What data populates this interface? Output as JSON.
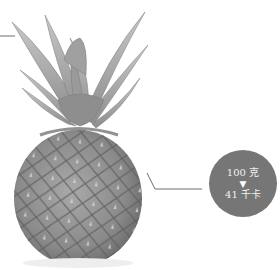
{
  "figure": {
    "callout": {
      "amount": "100 克",
      "arrow": "▼",
      "energy": "41 千卡"
    },
    "colors": {
      "circle_fill": "#767676",
      "circle_text": "#f2f2f2",
      "leader_line": "#6e6e6e"
    }
  }
}
